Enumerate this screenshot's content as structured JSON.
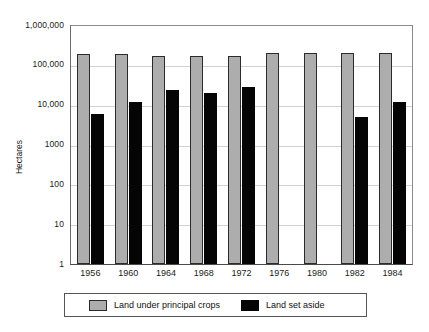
{
  "chart_data": {
    "type": "bar",
    "title": "",
    "subtitle": "",
    "xlabel": "",
    "ylabel": "Hectares",
    "yscale": "log",
    "ylim": [
      1,
      1000000
    ],
    "ytick_labels": [
      "1,000,000",
      "100,000",
      "10,000",
      "1000",
      "100",
      "10",
      "1"
    ],
    "ytick_values": [
      1000000,
      100000,
      10000,
      1000,
      100,
      10,
      1
    ],
    "grid": true,
    "legend_position": "bottom",
    "categories": [
      "1956",
      "1960",
      "1964",
      "1968",
      "1972",
      "1976",
      "1980",
      "1982",
      "1984"
    ],
    "series": [
      {
        "name": "Land under principal crops",
        "color": "#adadad",
        "values": [
          190000,
          190000,
          170000,
          170000,
          170000,
          200000,
          200000,
          200000,
          200000
        ]
      },
      {
        "name": "Land set aside",
        "color": "#050505",
        "values": [
          6000,
          12000,
          23000,
          20000,
          27000,
          null,
          null,
          5000,
          12000
        ]
      }
    ]
  },
  "legend": {
    "entries": [
      {
        "label": "Land under principal crops",
        "swatch": "crops"
      },
      {
        "label": "Land set aside",
        "swatch": "aside"
      }
    ]
  }
}
